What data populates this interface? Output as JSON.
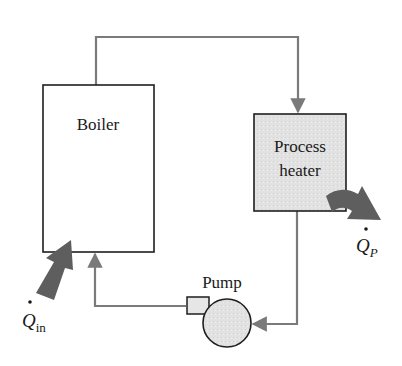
{
  "diagram": {
    "components": {
      "boiler": {
        "label": "Boiler",
        "fill": "#ffffff"
      },
      "process_heater": {
        "label_line1": "Process",
        "label_line2": "heater",
        "fill": "#e4e4e4"
      },
      "pump": {
        "label": "Pump",
        "fill": "#e6e6e6"
      }
    },
    "heat_flows": {
      "heat_in": {
        "symbol": "Q",
        "subscript": "in",
        "direction": "into boiler"
      },
      "heat_process": {
        "symbol": "Q",
        "subscript": "P",
        "direction": "out of process heater"
      }
    },
    "flow_path": [
      "Boiler",
      "Process heater",
      "Pump",
      "Boiler"
    ],
    "colors": {
      "outline": "#1e1e1e",
      "pipe": "#7a7a7a",
      "heat_arrow": "#5e5e5e",
      "background": "#ffffff"
    }
  }
}
